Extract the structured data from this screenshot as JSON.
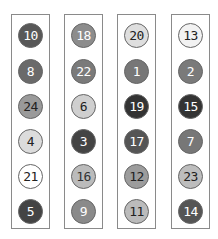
{
  "columns": [
    {
      "left": 11,
      "balls": [
        {
          "number": "10",
          "fill": "#585858",
          "text": "#ffffff"
        },
        {
          "number": "8",
          "fill": "#6a6a6a",
          "text": "#ffffff"
        },
        {
          "number": "24",
          "fill": "#9a9a9a",
          "text": "#222222"
        },
        {
          "number": "4",
          "fill": "#dcdcdc",
          "text": "#222222"
        },
        {
          "number": "21",
          "fill": "#ffffff",
          "text": "#222222"
        },
        {
          "number": "5",
          "fill": "#444444",
          "text": "#ffffff"
        }
      ]
    },
    {
      "left": 64,
      "balls": [
        {
          "number": "18",
          "fill": "#8c8c8c",
          "text": "#ffffff"
        },
        {
          "number": "22",
          "fill": "#7a7a7a",
          "text": "#ffffff"
        },
        {
          "number": "6",
          "fill": "#cfcfcf",
          "text": "#222222"
        },
        {
          "number": "3",
          "fill": "#444444",
          "text": "#ffffff"
        },
        {
          "number": "16",
          "fill": "#bbbbbb",
          "text": "#333333"
        },
        {
          "number": "9",
          "fill": "#8a8a8a",
          "text": "#ffffff"
        }
      ]
    },
    {
      "left": 117,
      "balls": [
        {
          "number": "20",
          "fill": "#dedede",
          "text": "#222222"
        },
        {
          "number": "1",
          "fill": "#777777",
          "text": "#ffffff"
        },
        {
          "number": "19",
          "fill": "#333333",
          "text": "#ffffff"
        },
        {
          "number": "17",
          "fill": "#555555",
          "text": "#ffffff"
        },
        {
          "number": "12",
          "fill": "#9c9c9c",
          "text": "#222222"
        },
        {
          "number": "11",
          "fill": "#bbbbbb",
          "text": "#222222"
        }
      ]
    },
    {
      "left": 171,
      "balls": [
        {
          "number": "13",
          "fill": "#f2f2f2",
          "text": "#222222"
        },
        {
          "number": "2",
          "fill": "#7a7a7a",
          "text": "#ffffff"
        },
        {
          "number": "15",
          "fill": "#333333",
          "text": "#ffffff"
        },
        {
          "number": "7",
          "fill": "#777777",
          "text": "#ffffff"
        },
        {
          "number": "23",
          "fill": "#bdbdbd",
          "text": "#222222"
        },
        {
          "number": "14",
          "fill": "#555555",
          "text": "#ffffff"
        }
      ]
    }
  ],
  "row_centers": [
    20,
    56,
    91,
    126,
    161,
    196
  ]
}
